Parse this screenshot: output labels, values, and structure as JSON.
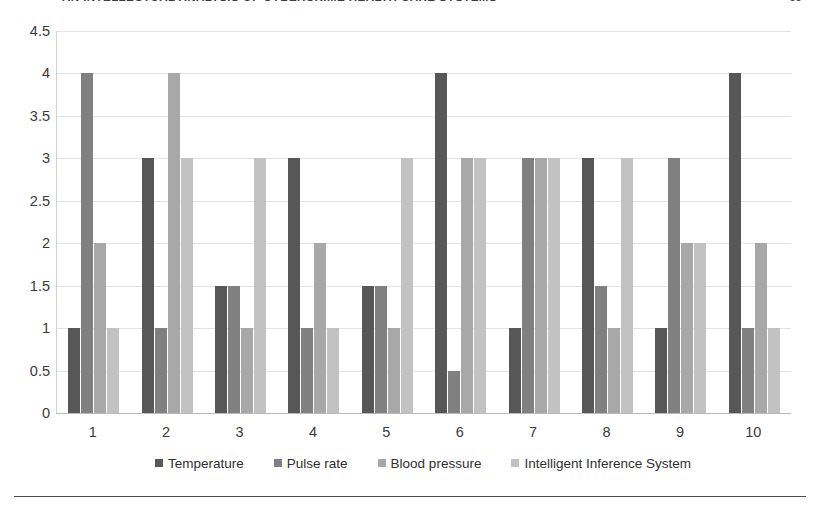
{
  "page": {
    "running_head": "AN INTELLECTUAL ANALYSIS OF CYBERCRIME HEALTH CARE SYSTEMS",
    "folio": "69"
  },
  "chart_data": {
    "type": "bar",
    "title": "",
    "subtitle": "",
    "xlabel": "",
    "ylabel": "",
    "categories": [
      "1",
      "2",
      "3",
      "4",
      "5",
      "6",
      "7",
      "8",
      "9",
      "10"
    ],
    "ylim": [
      0,
      4.5
    ],
    "ytick_labels": [
      "4.5",
      "4",
      "3.5",
      "3",
      "2.5",
      "2",
      "1.5",
      "1",
      "0.5",
      "0"
    ],
    "ytick_values": [
      4.5,
      4,
      3.5,
      3,
      2.5,
      2,
      1.5,
      1,
      0.5,
      0
    ],
    "grid": true,
    "grid_axis": "y",
    "legend_position": "bottom",
    "series": [
      {
        "name": "Temperature",
        "color": "#575757",
        "values": [
          1,
          3,
          1.5,
          3,
          1.5,
          4,
          1,
          3,
          1,
          4
        ]
      },
      {
        "name": "Pulse rate",
        "color": "#808080",
        "values": [
          4,
          1,
          1.5,
          1,
          1.5,
          0.5,
          3,
          1.5,
          3,
          1
        ]
      },
      {
        "name": "Blood pressure",
        "color": "#a8a8a8",
        "values": [
          2,
          4,
          1,
          2,
          1,
          3,
          3,
          1,
          2,
          2
        ]
      },
      {
        "name": "Intelligent Inference System",
        "color": "#c2c2c2",
        "values": [
          1,
          3,
          3,
          1,
          3,
          3,
          3,
          3,
          2,
          1
        ]
      }
    ]
  }
}
